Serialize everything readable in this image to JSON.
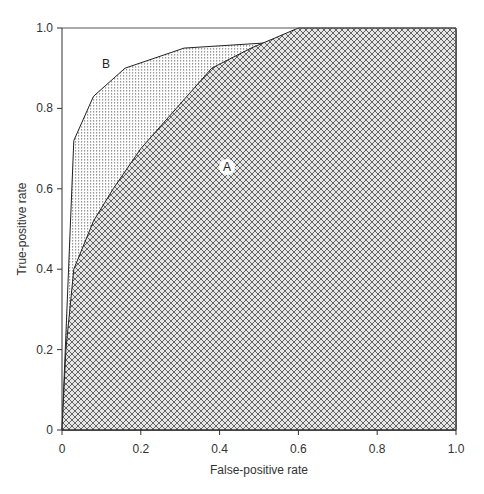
{
  "chart_data": {
    "type": "area",
    "title": "",
    "xlabel": "False-positive rate",
    "ylabel": "True-positive rate",
    "xlim": [
      0,
      1.0
    ],
    "ylim": [
      0,
      1.0
    ],
    "xticks": [
      "0",
      "0.2",
      "0.4",
      "0.6",
      "0.8",
      "1.0"
    ],
    "yticks": [
      "0",
      "0.2",
      "0.4",
      "0.6",
      "0.8",
      "1.0"
    ],
    "grid": false,
    "legend": "none",
    "series": [
      {
        "name": "A",
        "fill": "cross-hatch",
        "x": [
          0,
          0.01,
          0.03,
          0.08,
          0.13,
          0.2,
          0.29,
          0.38,
          0.48,
          0.6,
          1.0
        ],
        "y": [
          0,
          0.2,
          0.4,
          0.52,
          0.6,
          0.7,
          0.8,
          0.9,
          0.95,
          1.0,
          1.0
        ]
      },
      {
        "name": "B",
        "fill": "dotted",
        "x": [
          0,
          0.03,
          0.08,
          0.16,
          0.31,
          0.55,
          1.0
        ],
        "y": [
          0,
          0.72,
          0.83,
          0.9,
          0.95,
          0.965,
          0.995
        ]
      }
    ],
    "annotations": [
      {
        "text": "A",
        "x": 0.42,
        "y": 0.65
      },
      {
        "text": "B",
        "x": 0.11,
        "y": 0.91
      }
    ]
  },
  "labels": {
    "x_axis": "False-positive rate",
    "y_axis": "True-positive rate",
    "curve_a": "A",
    "curve_b": "B",
    "xt0": "0",
    "xt1": "0.2",
    "xt2": "0.4",
    "xt3": "0.6",
    "xt4": "0.8",
    "xt5": "1.0",
    "yt0": "0",
    "yt1": "0.2",
    "yt2": "0.4",
    "yt3": "0.6",
    "yt4": "0.8",
    "yt5": "1.0"
  }
}
